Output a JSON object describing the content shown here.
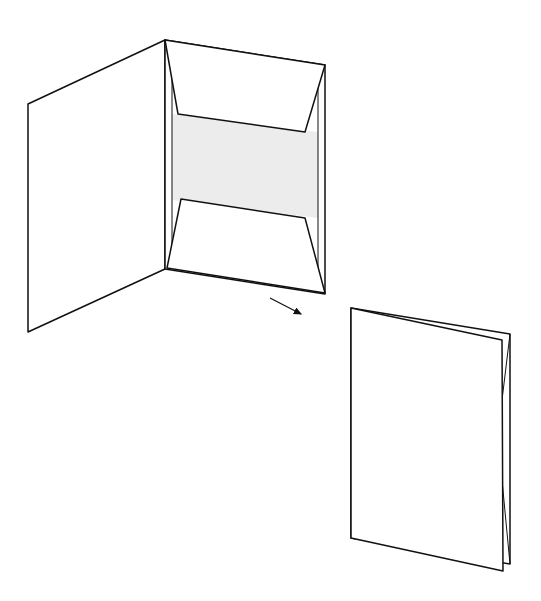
{
  "diagram": {
    "colors": {
      "stroke": "#111111",
      "fill": "#ffffff",
      "inner_shade": "#ececec"
    },
    "open_folder": {
      "left_panel": "28,104 165,40 165,269 28,332",
      "right_panel_outer": "165,40 325,65 325,294 165,269",
      "inner_shade": "172,114 318,132 318,218 172,200",
      "top_flap": "165,40 325,65 305,132 178,114",
      "bottom_flap": "181,199 305,218 325,293 167,268",
      "inner_left_line": "172,50 172,268",
      "inner_right_line": "318,66 318,292"
    },
    "arrow": {
      "from": [
        270,
        298
      ],
      "to": [
        303,
        315
      ]
    },
    "closed_booklet": {
      "back_page": "351,308 510,334 510,564 351,538",
      "front_cover": "351,308 502,340 503,571 351,538",
      "spine_line_a": "510,334 502,400",
      "spine_line_b": "502,480 510,564"
    }
  }
}
